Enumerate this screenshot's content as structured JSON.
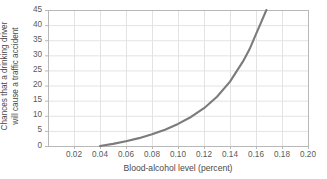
{
  "chart_data": {
    "type": "line",
    "title": "",
    "xlabel": "Blood-alcohol level (percent)",
    "ylabel_line1": "Chances that a drinking driver",
    "ylabel_line2": "will cause a traffic accident",
    "xlim": [
      0.0,
      0.2
    ],
    "ylim": [
      0,
      45
    ],
    "xticks": [
      "0.02",
      "0.04",
      "0.06",
      "0.08",
      "0.10",
      "0.12",
      "0.14",
      "0.16",
      "0.18",
      "0.20"
    ],
    "xtick_values": [
      0.02,
      0.04,
      0.06,
      0.08,
      0.1,
      0.12,
      0.14,
      0.16,
      0.18,
      0.2
    ],
    "yticks": [
      "0",
      "5",
      "10",
      "15",
      "20",
      "25",
      "30",
      "35",
      "40",
      "45"
    ],
    "ytick_values": [
      0,
      5,
      10,
      15,
      20,
      25,
      30,
      35,
      40,
      45
    ],
    "grid": true,
    "legend": "none",
    "series": [
      {
        "name": "Chances of causing a traffic accident",
        "color": "#7b7b7b",
        "x": [
          0.04,
          0.05,
          0.06,
          0.07,
          0.08,
          0.09,
          0.1,
          0.11,
          0.12,
          0.13,
          0.14,
          0.15,
          0.155,
          0.16,
          0.164,
          0.168
        ],
        "y": [
          0.0,
          0.7,
          1.6,
          2.6,
          3.9,
          5.4,
          7.3,
          9.6,
          12.5,
          16.3,
          21.3,
          28.0,
          32.0,
          37.0,
          41.0,
          45.0
        ]
      }
    ],
    "colors": {
      "curve": "#7b7b7b",
      "grid": "#e3e3e3",
      "frame": "#b8b8b8",
      "text": "#4a4a4a",
      "background": "#ffffff"
    }
  }
}
